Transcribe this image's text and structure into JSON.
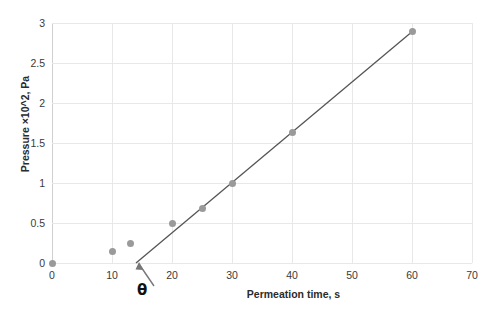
{
  "chart_data": {
    "type": "scatter",
    "title": "",
    "xlabel": "Permeation time, s",
    "ylabel": "Pressure ×10^2, Pa",
    "xlim": [
      0,
      70
    ],
    "ylim": [
      0,
      3
    ],
    "xticks": [
      0,
      10,
      20,
      30,
      40,
      50,
      60,
      70
    ],
    "xtick_labels": [
      "0",
      "10",
      "20",
      "30",
      "40",
      "50",
      "60",
      "70"
    ],
    "yticks": [
      0,
      0.5,
      1,
      1.5,
      2,
      2.5,
      3
    ],
    "ytick_labels": [
      "0",
      "0.5",
      "1",
      "1.5",
      "2",
      "2.5",
      "3"
    ],
    "grid": true,
    "legend": "none",
    "series": [
      {
        "name": "Pressure data",
        "marker": "circle",
        "color": "#9a9a9a",
        "points": [
          {
            "x": 0,
            "y": 0.0
          },
          {
            "x": 10,
            "y": 0.14
          },
          {
            "x": 13,
            "y": 0.24
          },
          {
            "x": 20,
            "y": 0.49
          },
          {
            "x": 25,
            "y": 0.68
          },
          {
            "x": 30,
            "y": 1.0
          },
          {
            "x": 40,
            "y": 1.63
          },
          {
            "x": 60,
            "y": 2.89
          }
        ]
      }
    ],
    "trendline": {
      "name": "Linear fit",
      "color": "#555555",
      "x_start": 14.0,
      "y_start": 0.0,
      "x_end": 60.0,
      "y_end": 2.89
    },
    "annotations": [
      {
        "name": "time-lag-theta",
        "label": "θ",
        "x": 14.0,
        "y": 0.0,
        "arrow": true
      }
    ]
  },
  "icons": {
    "annotation_arrow": "arrow-up-left-icon"
  },
  "colors": {
    "marker": "#9a9a9a",
    "trendline": "#555555",
    "gridline": "#e8e8e8",
    "axis": "#cfcfcf",
    "text": "#2b2b2b",
    "background": "#ffffff"
  }
}
